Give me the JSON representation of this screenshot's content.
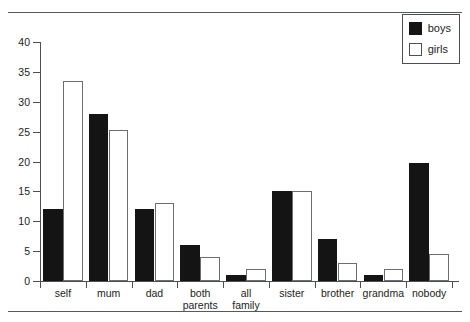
{
  "chart_data": {
    "type": "bar",
    "title": "",
    "xlabel": "",
    "ylabel": "",
    "ylim": [
      0,
      40
    ],
    "yticks": [
      0,
      5,
      10,
      15,
      20,
      25,
      30,
      35,
      40
    ],
    "grid": false,
    "legend_position": "top-right",
    "categories": [
      "self",
      "mum",
      "dad",
      "both parents",
      "all family",
      "sister",
      "brother",
      "grandma",
      "nobody"
    ],
    "category_lines": [
      [
        "self"
      ],
      [
        "mum"
      ],
      [
        "dad"
      ],
      [
        "both",
        "parents"
      ],
      [
        "all",
        "family"
      ],
      [
        "sister"
      ],
      [
        "brother"
      ],
      [
        "grandma"
      ],
      [
        "nobody"
      ]
    ],
    "series": [
      {
        "name": "boys",
        "color": "#141414",
        "style": "filled",
        "values": [
          12,
          28,
          12,
          6,
          1,
          15,
          7,
          1,
          19.8
        ]
      },
      {
        "name": "girls",
        "color": "#ffffff",
        "style": "outlined",
        "values": [
          33.4,
          25.2,
          13,
          4,
          2,
          15.1,
          3,
          2,
          4.5
        ]
      }
    ]
  },
  "legend": {
    "items": [
      {
        "label": "boys",
        "swatch": "filled-square"
      },
      {
        "label": "girls",
        "swatch": "outlined-square"
      }
    ]
  },
  "colors": {
    "boys_fill": "#141414",
    "girls_fill": "#ffffff",
    "axis": "#4c4f53",
    "rule": "#55585c",
    "text": "#1d1d1d",
    "background": "#ffffff"
  }
}
